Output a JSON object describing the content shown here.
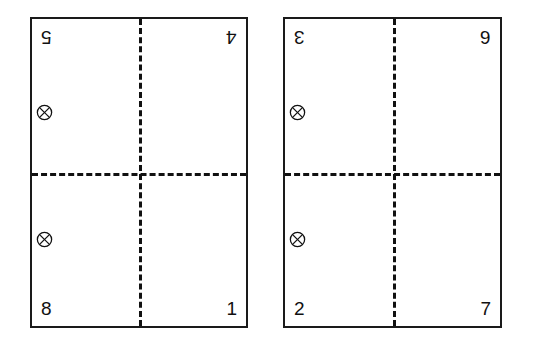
{
  "page": {
    "background_color": "#ffffff",
    "line_color": "#111111",
    "border_color": "#1a1a1a"
  },
  "panels": [
    {
      "id": "left-panel",
      "corners": {
        "top_left": {
          "label": "5",
          "rotated": true
        },
        "top_right": {
          "label": "4",
          "rotated": true
        },
        "bottom_left": {
          "label": "8",
          "rotated": false
        },
        "bottom_right": {
          "label": "1",
          "rotated": false
        }
      },
      "markers": [
        {
          "id": "marker-upper",
          "icon": "circled-x-icon"
        },
        {
          "id": "marker-lower",
          "icon": "circled-x-icon"
        }
      ]
    },
    {
      "id": "right-panel",
      "corners": {
        "top_left": {
          "label": "3",
          "rotated": true
        },
        "top_right": {
          "label": "6",
          "rotated": true
        },
        "bottom_left": {
          "label": "2",
          "rotated": false
        },
        "bottom_right": {
          "label": "7",
          "rotated": false
        }
      },
      "markers": [
        {
          "id": "marker-upper",
          "icon": "circled-x-icon"
        },
        {
          "id": "marker-lower",
          "icon": "circled-x-icon"
        }
      ]
    }
  ]
}
